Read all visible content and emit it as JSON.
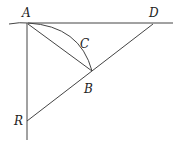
{
  "diagram": {
    "labels": {
      "A": "A",
      "B": "B",
      "C": "C",
      "D": "D",
      "R": "R"
    },
    "stroke_color": "#333333",
    "background": "#ffffff"
  }
}
